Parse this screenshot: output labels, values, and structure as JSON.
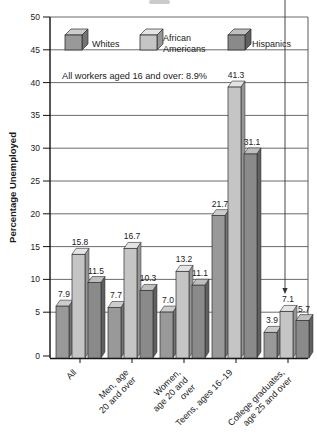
{
  "figure": {
    "background": "#ffffff",
    "has_cropped_text_artifact_top": true
  },
  "chart_data": {
    "type": "bar",
    "title": "",
    "ylabel": "Percentage Unemployed",
    "xlabel": "",
    "annotation": "All workers aged 16 and over: 8.9%",
    "ylim": [
      0,
      50
    ],
    "ytick_step": 5,
    "grid": true,
    "legend_position": "top-inside",
    "style": "3d-bars",
    "categories": [
      "All",
      "Men, age 20 and over",
      "Women, age 20 and over",
      "Teens, ages 16–19",
      "College graduates, age 25 and over"
    ],
    "category_label_lines": [
      [
        "All"
      ],
      [
        "Men, age",
        "20 and over"
      ],
      [
        "Women,",
        "age 20 and",
        "over"
      ],
      [
        "Teens, ages 16–19"
      ],
      [
        "College graduates,",
        "age 25 and over"
      ]
    ],
    "series": [
      {
        "name": "Whites",
        "legend_lines": [
          "Whites"
        ],
        "values": [
          7.9,
          7.7,
          7.0,
          21.7,
          3.9
        ],
        "color_front": "#999999",
        "color_top": "#cccccc",
        "color_side": "#737373"
      },
      {
        "name": "African Americans",
        "legend_lines": [
          "African",
          "Americans"
        ],
        "values": [
          15.8,
          16.7,
          13.2,
          41.3,
          7.1
        ],
        "color_front": "#c5c5c5",
        "color_top": "#e4e4e4",
        "color_side": "#969696"
      },
      {
        "name": "Hispanics",
        "legend_lines": [
          "Hispanics"
        ],
        "values": [
          11.5,
          10.3,
          11.1,
          31.1,
          5.7
        ],
        "color_front": "#8a8a8a",
        "color_top": "#bfbfbf",
        "color_side": "#606060"
      }
    ],
    "callout_arrow": {
      "points_to_series": "African Americans",
      "points_to_category": "College graduates, age 25 and over",
      "points_to_value": "7.1"
    },
    "axis_color": "#111111",
    "grid_color": "#5a5a5a",
    "text_color": "#1a1a1a"
  }
}
